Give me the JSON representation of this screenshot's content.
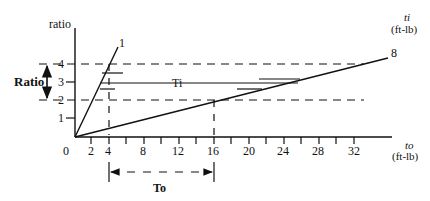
{
  "diagram": {
    "y_axis": {
      "label": "ratio",
      "ticks": [
        "1",
        "2",
        "3",
        "4"
      ]
    },
    "x_axis": {
      "label_symbol": "to",
      "label_unit": "(ft-lb)",
      "ticks": [
        "0",
        "2",
        "4",
        "8",
        "12",
        "16",
        "20",
        "24",
        "28",
        "32"
      ]
    },
    "right_label": {
      "symbol": "ti",
      "unit": "(ft-lb)"
    },
    "lines": [
      {
        "label": "1",
        "description": "steep ratio line (ratio 1)"
      },
      {
        "label": "8",
        "description": "shallow ratio line (ratio 8)"
      }
    ],
    "ti_label": "Ti",
    "to_label": "To",
    "ratio_label": "Ratio",
    "ratio_range": {
      "from": "2",
      "to": "4"
    },
    "to_range": {
      "from": "4",
      "to": "16"
    }
  }
}
